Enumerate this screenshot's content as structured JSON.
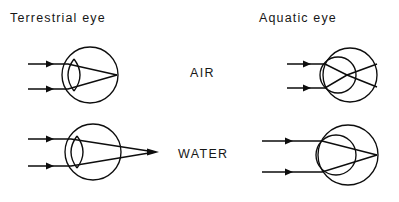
{
  "figure": {
    "width": 399,
    "height": 202,
    "background_color": "#ffffff",
    "ink_color": "#0d0d0d"
  },
  "headings": {
    "terrestrial": "Terrestrial eye",
    "aquatic": "Aquatic eye"
  },
  "medium_labels": {
    "air": "AIR",
    "water": "WATER"
  },
  "panels": [
    {
      "id": "terrestrial-in-air",
      "eye_type": "Terrestrial eye",
      "medium": "AIR",
      "row": "top",
      "column": "left",
      "lens_shape": "biconvex",
      "focus_location": "on retina",
      "ray_count": 2
    },
    {
      "id": "aquatic-in-air",
      "eye_type": "Aquatic eye",
      "medium": "AIR",
      "row": "top",
      "column": "right",
      "lens_shape": "spherical",
      "focus_location": "in front of retina",
      "ray_count": 2
    },
    {
      "id": "terrestrial-in-water",
      "eye_type": "Terrestrial eye",
      "medium": "WATER",
      "row": "bottom",
      "column": "left",
      "lens_shape": "biconvex",
      "focus_location": "behind retina",
      "ray_count": 2
    },
    {
      "id": "aquatic-in-water",
      "eye_type": "Aquatic eye",
      "medium": "WATER",
      "row": "bottom",
      "column": "right",
      "lens_shape": "spherical",
      "focus_location": "on retina",
      "ray_count": 2
    }
  ]
}
